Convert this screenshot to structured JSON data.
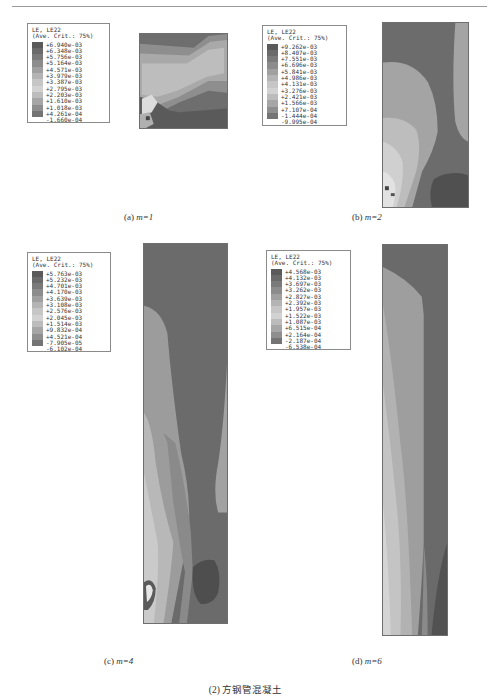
{
  "figure": {
    "caption": "(2) 方钢管混凝土",
    "panels": [
      {
        "id": "a",
        "label": "(a) ",
        "param": "m=1",
        "legend": {
          "title_line1": "LE, LE22",
          "title_line2": "(Ave. Crit.: 75%)",
          "values": [
            "+6.940e-03",
            "+6.348e-03",
            "+5.756e-03",
            "+5.164e-03",
            "+4.571e-03",
            "+3.979e-03",
            "+3.387e-03",
            "+2.795e-03",
            "+2.203e-03",
            "+1.610e-03",
            "+1.018e-03",
            "+4.261e-04",
            "-1.660e-04"
          ]
        }
      },
      {
        "id": "b",
        "label": "(b) ",
        "param": "m=2",
        "legend": {
          "title_line1": "LE, LE22",
          "title_line2": "(Ave. Crit.: 75%)",
          "values": [
            "+9.262e-03",
            "+8.407e-03",
            "+7.551e-03",
            "+6.696e-03",
            "+5.841e-03",
            "+4.986e-03",
            "+4.131e-03",
            "+3.276e-03",
            "+2.421e-03",
            "+1.566e-03",
            "+7.107e-04",
            "-1.444e-04",
            "-9.995e-04"
          ]
        }
      },
      {
        "id": "c",
        "label": "(c) ",
        "param": "m=4",
        "legend": {
          "title_line1": "LE, LE22",
          "title_line2": "(Ave. Crit.: 75%)",
          "values": [
            "+5.763e-03",
            "+5.232e-03",
            "+4.701e-03",
            "+4.170e-03",
            "+3.639e-03",
            "+3.108e-03",
            "+2.576e-03",
            "+2.045e-03",
            "+1.514e-03",
            "+9.832e-04",
            "+4.521e-04",
            "-7.905e-05",
            "-6.102e-04"
          ]
        }
      },
      {
        "id": "d",
        "label": "(d) ",
        "param": "m=6",
        "legend": {
          "title_line1": "LE, LE22",
          "title_line2": "(Ave. Crit.: 75%)",
          "values": [
            "+4.568e-03",
            "+4.132e-03",
            "+3.697e-03",
            "+3.262e-03",
            "+2.827e-03",
            "+2.392e-03",
            "+1.957e-03",
            "+1.522e-03",
            "+1.087e-03",
            "+6.515e-04",
            "+2.164e-04",
            "-2.187e-04",
            "-6.538e-04"
          ]
        }
      }
    ],
    "legend_swatch_colors": [
      "#5a5a5a",
      "#6a6a6a",
      "#7a7a7a",
      "#8c8c8c",
      "#a0a0a0",
      "#b4b4b4",
      "#c6c6c6",
      "#d2d2d2",
      "#bcbcbc",
      "#a6a6a6",
      "#8e8e8e",
      "#747474",
      "#5e5e5e"
    ]
  }
}
